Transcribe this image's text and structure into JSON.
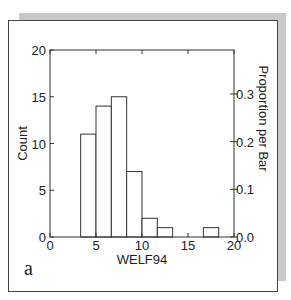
{
  "panel_label": "a",
  "chart_data": {
    "type": "bar",
    "subtype": "histogram",
    "title": "",
    "xlabel": "WELF94",
    "ylabel": "Count",
    "ylabel_right": "Proportion per Bar",
    "xlim": [
      0,
      20
    ],
    "ylim": [
      0,
      20
    ],
    "ylim_right": [
      0,
      0.392
    ],
    "x_ticks": [
      0,
      5,
      10,
      15,
      20
    ],
    "x_tick_labels": [
      "0",
      "5",
      "10",
      "15",
      "20"
    ],
    "y_ticks": [
      0,
      5,
      10,
      15,
      20
    ],
    "y_tick_labels": [
      "0",
      "5",
      "10",
      "15",
      "20"
    ],
    "y_right_ticks": [
      0.0,
      0.1,
      0.2,
      0.3
    ],
    "y_right_tick_labels": [
      "0.0",
      "0.1",
      "0.2",
      "0.3"
    ],
    "grid": false,
    "legend": null,
    "bin_width": 1.667,
    "bins": [
      {
        "x0": 3.333,
        "x1": 5.0,
        "count": 11
      },
      {
        "x0": 5.0,
        "x1": 6.667,
        "count": 14
      },
      {
        "x0": 6.667,
        "x1": 8.333,
        "count": 15
      },
      {
        "x0": 8.333,
        "x1": 10.0,
        "count": 7
      },
      {
        "x0": 10.0,
        "x1": 11.667,
        "count": 2
      },
      {
        "x0": 11.667,
        "x1": 13.333,
        "count": 1
      },
      {
        "x0": 13.333,
        "x1": 15.0,
        "count": 0
      },
      {
        "x0": 15.0,
        "x1": 16.667,
        "count": 0
      },
      {
        "x0": 16.667,
        "x1": 18.333,
        "count": 1
      }
    ],
    "categories": [
      "3.3-5.0",
      "5.0-6.7",
      "6.7-8.3",
      "8.3-10.0",
      "10.0-11.7",
      "11.7-13.3",
      "13.3-15.0",
      "15.0-16.7",
      "16.7-18.3"
    ],
    "values": [
      11,
      14,
      15,
      7,
      2,
      1,
      0,
      0,
      1
    ],
    "total_count": 51
  }
}
